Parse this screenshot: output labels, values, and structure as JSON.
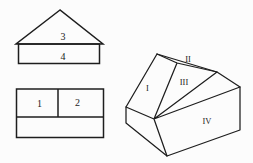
{
  "diagram": {
    "front_view": {
      "triangle_label": "3",
      "rectangle_label": "4"
    },
    "plan_view": {
      "cell1_label": "1",
      "cell2_label": "2"
    },
    "solid": {
      "left_slope_label": "I",
      "top_sliver_label": "II",
      "front_slope_label": "III",
      "front_face_label": "IV"
    },
    "colors": {
      "line": "#1e1e1e",
      "background": "#fcfcfc"
    }
  }
}
